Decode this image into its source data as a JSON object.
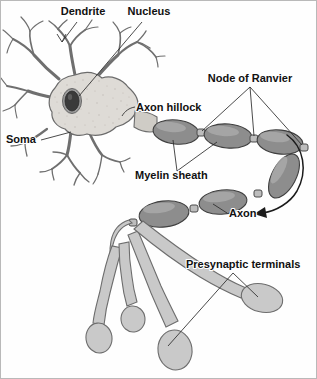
{
  "figure": {
    "background_color": "#ffffff",
    "border_color": "#b9b9b9",
    "style": "scanned textbook line illustration, grayscale"
  },
  "palette": {
    "soma_fill": "#dedbd6",
    "soma_outline": "#6b6b6b",
    "nucleus_fill": "#3a3a3a",
    "nucleus_rim": "#8a8a8a",
    "dendrite_stroke": "#6f6f6f",
    "myelin_fill": "#8d8d8d",
    "myelin_highlight": "#a9a9a9",
    "myelin_outline": "#3f3f3f",
    "node_fill": "#bdbdbd",
    "terminal_fill": "#c9c9c9",
    "terminal_outline": "#6d6d6d",
    "label_text": "#111111",
    "leader_line": "#2a2a2a",
    "arrow_color": "#1b1b1b"
  },
  "labels": [
    {
      "id": "dendrite",
      "text": "Dendrite",
      "x": 82,
      "y": 14,
      "anchor": "middle"
    },
    {
      "id": "nucleus",
      "text": "Nucleus",
      "x": 148,
      "y": 14,
      "anchor": "middle"
    },
    {
      "id": "node-of-ranvier",
      "text": "Node of Ranvier",
      "x": 249,
      "y": 81,
      "anchor": "middle"
    },
    {
      "id": "axon-hillock",
      "text": "Axon hillock",
      "x": 135,
      "y": 110,
      "anchor": "start"
    },
    {
      "id": "soma",
      "text": "Soma",
      "x": 5,
      "y": 142,
      "anchor": "start"
    },
    {
      "id": "myelin-sheath",
      "text": "Myelin sheath",
      "x": 134,
      "y": 178,
      "anchor": "start"
    },
    {
      "id": "axon",
      "text": "Axon",
      "x": 228,
      "y": 216,
      "anchor": "start"
    },
    {
      "id": "presynaptic-terminals",
      "text": "Presynaptic terminals",
      "x": 185,
      "y": 267,
      "anchor": "start"
    }
  ],
  "structures": {
    "soma": {
      "name": "Soma (cell body)",
      "description": "Light gray stippled polygon forming the cell body"
    },
    "nucleus": {
      "name": "Nucleus",
      "description": "Dark ellipse set within the soma",
      "cx": 71,
      "cy": 100,
      "rx": 8,
      "ry": 11
    },
    "dendrites": {
      "name": "Dendrites",
      "description": "Thin tapering branched processes radiating from the soma",
      "count": 6
    },
    "axon_hillock": {
      "name": "Axon hillock",
      "description": "Tapering cone where the soma narrows into the axon"
    },
    "myelin_segments": {
      "name": "Myelin sheath segments",
      "description": "Dark gray oval internodes along the axon",
      "count": 6
    },
    "nodes_of_ranvier": {
      "name": "Nodes of Ranvier",
      "description": "Narrow gaps between adjacent myelin segments",
      "count": 5
    },
    "presynaptic_terminals": {
      "name": "Presynaptic terminals",
      "description": "Branching axon endings tipped with bulbs",
      "count": 4
    },
    "continuation_arrow": {
      "name": "Axon continuation arrow",
      "description": "Curved arrow wrapping from the first axon row down to the second row"
    }
  }
}
